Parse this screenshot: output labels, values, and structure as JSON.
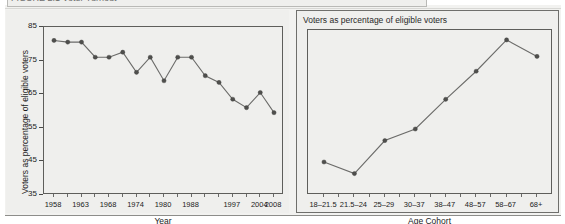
{
  "figure": {
    "caption": "FIGURE 2.1   Voter Turnout",
    "background_color": "#efefed",
    "line_color": "#6b6b69",
    "marker_color": "#4f4f4d"
  },
  "left_panel": {
    "title": "",
    "y_axis_title": "Voters as percentage of eligible voters",
    "x_axis_title": "Year"
  },
  "right_panel": {
    "title": "Voters as percentage of eligible voters",
    "x_axis_title": "Age Cohort"
  },
  "chart_data": [
    {
      "type": "line",
      "title": "",
      "xlabel": "Year",
      "ylabel": "Voters as percentage of eligible voters",
      "ylim": [
        35,
        85
      ],
      "yticks": [
        35,
        45,
        55,
        65,
        75,
        85
      ],
      "grid": false,
      "legend": "none",
      "tick_labels": [
        "1958",
        "1963",
        "1968",
        "1974",
        "1980",
        "1988",
        "1997",
        "2004",
        "2008"
      ],
      "x": [
        "1958",
        "1960",
        "1963",
        "1965",
        "1968",
        "1971",
        "1974",
        "1977",
        "1980",
        "1983",
        "1988",
        "1991",
        "1994",
        "1997",
        "2001",
        "2004",
        "2008"
      ],
      "values": [
        81,
        80.5,
        80.5,
        76,
        76,
        77.5,
        71.5,
        76,
        69,
        76,
        76,
        70.5,
        68.5,
        63.5,
        61,
        65.5,
        59.5
      ]
    },
    {
      "type": "line",
      "title": "Voters as percentage of eligible voters",
      "xlabel": "Age Cohort",
      "ylabel": "",
      "ylim": [
        35,
        85
      ],
      "grid": false,
      "legend": "none",
      "categories": [
        "18–21.5",
        "21.5–24",
        "25–29",
        "30–37",
        "38–47",
        "48–57",
        "58–67",
        "68+"
      ],
      "values": [
        45,
        41.5,
        51.5,
        55,
        64,
        72.5,
        82,
        77
      ]
    }
  ]
}
